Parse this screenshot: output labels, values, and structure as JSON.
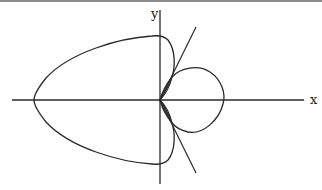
{
  "diagram": {
    "type": "polar-curve-plot",
    "axes": {
      "x_label": "x",
      "y_label": "y"
    },
    "elements": [
      "outer large lobe (left)",
      "right circular lobe",
      "two small inner loops near origin",
      "two tangent lines through origin"
    ],
    "colors": {
      "stroke": "#2a2a2a",
      "background": "#ffffff"
    }
  }
}
